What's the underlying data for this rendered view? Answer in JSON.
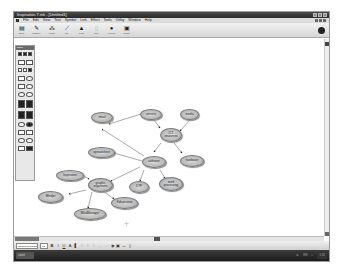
{
  "window": {
    "title": "Inspiration 7.ink - [Untitled1]"
  },
  "menubar": {
    "items": [
      "File",
      "Edit",
      "View",
      "Text",
      "Symbol",
      "Link",
      "Effect",
      "Tools",
      "Utility",
      "Window",
      "Help"
    ]
  },
  "toolbar": {
    "buttons": [
      {
        "label": "Outline",
        "icon": "outline-icon",
        "glyph": "▤"
      },
      {
        "label": "RapidFire",
        "icon": "rapidfire-icon",
        "glyph": "✎"
      },
      {
        "label": "Arrange",
        "icon": "arrange-icon",
        "glyph": "⁂"
      },
      {
        "label": "Link",
        "icon": "link-icon",
        "glyph": "⟋"
      },
      {
        "label": "Create",
        "icon": "create-icon",
        "glyph": "▲"
      },
      {
        "label": "Note",
        "icon": "note-icon",
        "glyph": "▯"
      },
      {
        "label": "Hyperlink",
        "icon": "hyperlink-icon",
        "glyph": "●"
      },
      {
        "label": "Transfer",
        "icon": "transfer-icon",
        "glyph": "▣"
      }
    ]
  },
  "palette": {
    "title": "Basic"
  },
  "diagram": {
    "nodes": [
      {
        "id": "email",
        "label": "email"
      },
      {
        "id": "servers",
        "label": "servers"
      },
      {
        "id": "media",
        "label": "media"
      },
      {
        "id": "ict",
        "label": "ICT resources"
      },
      {
        "id": "spreadsheet",
        "label": "spreadsheet"
      },
      {
        "id": "software",
        "label": "software"
      },
      {
        "id": "hardware",
        "label": "hardware"
      },
      {
        "id": "inspiration",
        "label": "Inspiration"
      },
      {
        "id": "graphic",
        "label": "graphic organisers"
      },
      {
        "id": "dtp",
        "label": "DTP"
      },
      {
        "id": "wordproc",
        "label": "word processing"
      },
      {
        "id": "mindjet",
        "label": "Mindjet"
      },
      {
        "id": "kidspiration",
        "label": "Kidspiration"
      },
      {
        "id": "mindmanager",
        "label": "MindManager"
      }
    ]
  },
  "format_bar": {
    "font": "Times New Roman",
    "size": "12",
    "bold": "B",
    "italic": "I",
    "underline": "U",
    "color": "A"
  },
  "taskbar": {
    "start_label": "start",
    "clock": "1:52"
  }
}
